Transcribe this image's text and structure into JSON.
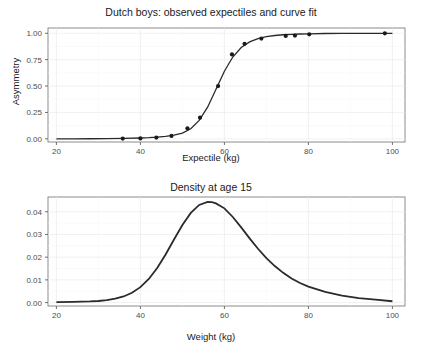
{
  "figure": {
    "background": "#ffffff",
    "panel_background": "#ffffff",
    "grid_color": "#ebebeb",
    "border_color": "#7f7f7f",
    "curve_color": "#2b2b2b",
    "point_color": "#1a1a1a"
  },
  "chart_data": [
    {
      "type": "line",
      "title": "Dutch boys: observed expectiles and curve fit",
      "xlabel": "Expectile (kg)",
      "ylabel": "Asymmetry",
      "xlim": [
        18,
        103
      ],
      "ylim": [
        -0.03,
        1.05
      ],
      "xticks": [
        20,
        40,
        60,
        80,
        100
      ],
      "xtick_labels": [
        "20",
        "40",
        "60",
        "80",
        "100"
      ],
      "yticks": [
        0.0,
        0.25,
        0.5,
        0.75,
        1.0
      ],
      "ytick_labels": [
        "0.00",
        "0.25",
        "0.50",
        "0.75",
        "1.00"
      ],
      "grid": true,
      "legend": "none",
      "series": [
        {
          "name": "curve fit",
          "kind": "line",
          "x": [
            20,
            24,
            28,
            32,
            36,
            40,
            42,
            44,
            46,
            48,
            50,
            52,
            54,
            56,
            58,
            60,
            62,
            64,
            66,
            68,
            70,
            72,
            74,
            76,
            78,
            80,
            84,
            88,
            92,
            96,
            100
          ],
          "y": [
            0.0,
            0.0,
            0.001,
            0.002,
            0.004,
            0.008,
            0.011,
            0.016,
            0.024,
            0.036,
            0.055,
            0.095,
            0.175,
            0.3,
            0.47,
            0.64,
            0.775,
            0.865,
            0.918,
            0.95,
            0.968,
            0.979,
            0.986,
            0.99,
            0.993,
            0.995,
            0.998,
            0.999,
            1.0,
            1.0,
            1.0
          ]
        },
        {
          "name": "observed expectiles",
          "kind": "points",
          "x": [
            35.8,
            40.0,
            43.8,
            47.4,
            51.2,
            54.2,
            58.5,
            61.8,
            64.8,
            68.8,
            74.6,
            76.8,
            80.2,
            98.2
          ],
          "y": [
            0.002,
            0.004,
            0.012,
            0.028,
            0.1,
            0.2,
            0.5,
            0.8,
            0.9,
            0.95,
            0.975,
            0.978,
            0.99,
            1.0
          ]
        }
      ]
    },
    {
      "type": "line",
      "title": "Density at age 15",
      "xlabel": "Weight (kg)",
      "ylabel": "",
      "xlim": [
        18,
        103
      ],
      "ylim": [
        -0.0015,
        0.0465
      ],
      "xticks": [
        20,
        40,
        60,
        80,
        100
      ],
      "xtick_labels": [
        "20",
        "40",
        "60",
        "80",
        "100"
      ],
      "yticks": [
        0.0,
        0.01,
        0.02,
        0.03,
        0.04
      ],
      "ytick_labels": [
        "0.00",
        "0.01",
        "0.02",
        "0.03",
        "0.04"
      ],
      "grid": true,
      "legend": "none",
      "peak": {
        "x": 56.5,
        "y": 0.0443
      },
      "series": [
        {
          "name": "density",
          "kind": "line",
          "x": [
            20,
            24,
            28,
            30,
            32,
            34,
            36,
            38,
            40,
            42,
            44,
            46,
            48,
            50,
            52,
            54,
            56,
            57,
            58,
            60,
            62,
            64,
            66,
            68,
            70,
            72,
            74,
            76,
            78,
            80,
            84,
            88,
            92,
            96,
            100
          ],
          "y": [
            0.0002,
            0.0003,
            0.0005,
            0.0007,
            0.0011,
            0.0017,
            0.0027,
            0.0043,
            0.0068,
            0.0104,
            0.0152,
            0.0212,
            0.0278,
            0.0342,
            0.0395,
            0.043,
            0.0443,
            0.0442,
            0.0437,
            0.0415,
            0.0377,
            0.0331,
            0.0283,
            0.0237,
            0.0196,
            0.0161,
            0.0131,
            0.0106,
            0.0086,
            0.007,
            0.0047,
            0.0031,
            0.002,
            0.0013,
            0.0006
          ]
        }
      ]
    }
  ]
}
